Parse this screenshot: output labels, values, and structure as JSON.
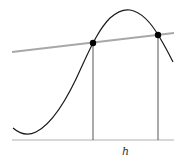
{
  "diagram": {
    "type": "secant-line-on-curve",
    "label_h": "h",
    "colors": {
      "curve": "#1a1a1a",
      "secant": "#a8a8a8",
      "axis": "#b0b0b0",
      "droplines": "#444444",
      "points": "#000000"
    },
    "points": [
      {
        "name": "left-intersection",
        "x": 93,
        "y": 43
      },
      {
        "name": "right-intersection",
        "x": 158,
        "y": 35
      }
    ]
  }
}
